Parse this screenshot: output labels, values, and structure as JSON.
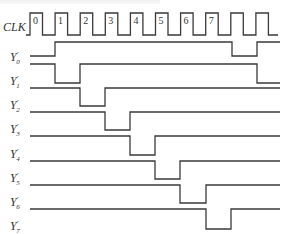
{
  "diagram": {
    "type": "timing-diagram",
    "clock": {
      "label": "CLK",
      "first_rising_x": 30,
      "period_px": 25.1,
      "high_width_px": 12.5,
      "pulses": 10,
      "pulse_numbers": [
        "0",
        "1",
        "2",
        "3",
        "4",
        "5",
        "6",
        "7"
      ],
      "high_y": 13,
      "low_y": 35
    },
    "signals": [
      {
        "label": "Y",
        "prime": "′",
        "index": "0",
        "high_y": 42,
        "low_y": 56,
        "start": "low",
        "transitions": [
          55,
          232,
          257
        ],
        "label_y": 61
      },
      {
        "label": "Y",
        "prime": "′",
        "index": "1",
        "high_y": 64,
        "low_y": 83,
        "start": "high",
        "transitions": [
          55,
          80,
          257
        ],
        "label_y": 85
      },
      {
        "label": "Y",
        "prime": "′",
        "index": "2",
        "high_y": 88,
        "low_y": 106,
        "start": "high",
        "transitions": [
          80,
          105
        ],
        "label_y": 109
      },
      {
        "label": "Y",
        "prime": "′",
        "index": "3",
        "high_y": 112,
        "low_y": 130,
        "start": "high",
        "transitions": [
          105,
          130
        ],
        "label_y": 133
      },
      {
        "label": "Y",
        "prime": "′",
        "index": "4",
        "high_y": 136,
        "low_y": 155,
        "start": "high",
        "transitions": [
          130,
          155
        ],
        "label_y": 158
      },
      {
        "label": "Y",
        "prime": "′",
        "index": "5",
        "high_y": 161,
        "low_y": 179,
        "start": "high",
        "transitions": [
          155,
          180
        ],
        "label_y": 182
      },
      {
        "label": "Y",
        "prime": "′",
        "index": "6",
        "high_y": 185,
        "low_y": 203,
        "start": "high",
        "transitions": [
          180,
          206
        ],
        "label_y": 206
      },
      {
        "label": "Y",
        "prime": "′",
        "index": "7",
        "high_y": 209,
        "low_y": 229,
        "start": "high",
        "transitions": [
          206,
          231
        ],
        "label_y": 230
      }
    ],
    "x_start": 30,
    "x_end": 280,
    "stroke_color": "#3a3a3a",
    "text_color": "#333333"
  }
}
